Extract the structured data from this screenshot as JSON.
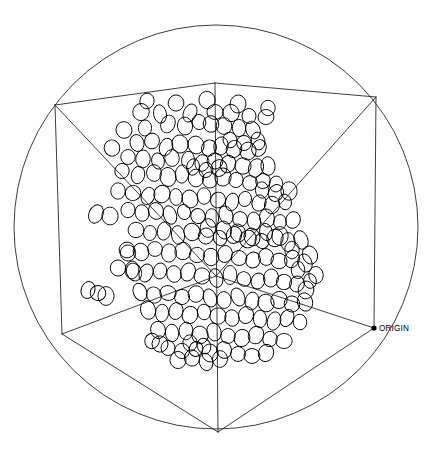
{
  "figure": {
    "background_color": "#ffffff",
    "line_color": "#1a1a1a",
    "marker_color": "#000000",
    "width": 432,
    "height": 450
  },
  "annotations": {
    "origin_label": "ORIGIN",
    "origin_point": {
      "x": 374,
      "y": 328
    }
  },
  "chart_data": {
    "type": "scatter",
    "title": "",
    "subtitle": "",
    "xlabel": "",
    "ylabel": "",
    "zlabel": "",
    "projection": "3d-oblique-wireframe-cube",
    "grid": false,
    "legend": null,
    "marker_shape": "open-ellipse",
    "marker_rx": 7.2,
    "marker_ry": 8.4,
    "n_points": 184,
    "bounding_circle": {
      "cx": 216,
      "cy": 227,
      "r": 202
    },
    "cube_vertices": {
      "front_bottom": {
        "x": 218,
        "y": 432
      },
      "left": {
        "x": 55,
        "y": 105
      },
      "left_bottom": {
        "x": 62,
        "y": 334
      },
      "right": {
        "x": 376,
        "y": 97
      },
      "right_bottom": {
        "x": 374,
        "y": 328
      },
      "top_center": {
        "x": 215,
        "y": 83
      },
      "center": {
        "x": 216,
        "y": 276
      },
      "top_front": {
        "x": 216,
        "y": 83
      }
    },
    "points": [
      [
        147,
        101
      ],
      [
        176,
        103
      ],
      [
        207,
        100
      ],
      [
        238,
        104
      ],
      [
        268,
        108
      ],
      [
        141,
        112
      ],
      [
        160,
        114
      ],
      [
        190,
        113
      ],
      [
        215,
        112
      ],
      [
        231,
        113
      ],
      [
        249,
        116
      ],
      [
        266,
        117
      ],
      [
        124,
        130
      ],
      [
        145,
        128
      ],
      [
        168,
        124
      ],
      [
        185,
        126
      ],
      [
        199,
        122
      ],
      [
        211,
        124
      ],
      [
        224,
        126
      ],
      [
        239,
        128
      ],
      [
        253,
        130
      ],
      [
        137,
        143
      ],
      [
        152,
        141
      ],
      [
        166,
        147
      ],
      [
        180,
        144
      ],
      [
        196,
        145
      ],
      [
        209,
        148
      ],
      [
        221,
        146
      ],
      [
        234,
        149
      ],
      [
        248,
        151
      ],
      [
        259,
        148
      ],
      [
        112,
        148
      ],
      [
        128,
        157
      ],
      [
        143,
        159
      ],
      [
        158,
        161
      ],
      [
        172,
        158
      ],
      [
        188,
        160
      ],
      [
        202,
        163
      ],
      [
        215,
        161
      ],
      [
        228,
        164
      ],
      [
        243,
        166
      ],
      [
        256,
        168
      ],
      [
        268,
        166
      ],
      [
        122,
        171
      ],
      [
        138,
        175
      ],
      [
        154,
        173
      ],
      [
        168,
        177
      ],
      [
        182,
        174
      ],
      [
        196,
        178
      ],
      [
        210,
        180
      ],
      [
        223,
        177
      ],
      [
        236,
        180
      ],
      [
        250,
        183
      ],
      [
        263,
        181
      ],
      [
        276,
        184
      ],
      [
        118,
        191
      ],
      [
        133,
        193
      ],
      [
        148,
        196
      ],
      [
        162,
        194
      ],
      [
        176,
        197
      ],
      [
        190,
        199
      ],
      [
        204,
        196
      ],
      [
        218,
        200
      ],
      [
        232,
        202
      ],
      [
        245,
        199
      ],
      [
        259,
        203
      ],
      [
        272,
        205
      ],
      [
        285,
        202
      ],
      [
        128,
        210
      ],
      [
        142,
        213
      ],
      [
        156,
        211
      ],
      [
        170,
        215
      ],
      [
        184,
        212
      ],
      [
        198,
        216
      ],
      [
        212,
        218
      ],
      [
        226,
        215
      ],
      [
        240,
        219
      ],
      [
        254,
        221
      ],
      [
        267,
        218
      ],
      [
        280,
        222
      ],
      [
        293,
        220
      ],
      [
        96,
        214
      ],
      [
        110,
        216
      ],
      [
        136,
        230
      ],
      [
        150,
        233
      ],
      [
        164,
        231
      ],
      [
        178,
        235
      ],
      [
        192,
        232
      ],
      [
        206,
        236
      ],
      [
        220,
        238
      ],
      [
        234,
        235
      ],
      [
        248,
        239
      ],
      [
        262,
        241
      ],
      [
        275,
        238
      ],
      [
        288,
        242
      ],
      [
        301,
        240
      ],
      [
        127,
        250
      ],
      [
        141,
        252
      ],
      [
        155,
        249
      ],
      [
        169,
        253
      ],
      [
        183,
        251
      ],
      [
        197,
        255
      ],
      [
        211,
        257
      ],
      [
        225,
        254
      ],
      [
        239,
        258
      ],
      [
        253,
        260
      ],
      [
        266,
        257
      ],
      [
        279,
        261
      ],
      [
        292,
        259
      ],
      [
        305,
        263
      ],
      [
        118,
        268
      ],
      [
        132,
        270
      ],
      [
        146,
        273
      ],
      [
        160,
        271
      ],
      [
        174,
        274
      ],
      [
        188,
        272
      ],
      [
        202,
        276
      ],
      [
        216,
        278
      ],
      [
        230,
        275
      ],
      [
        244,
        279
      ],
      [
        258,
        281
      ],
      [
        271,
        278
      ],
      [
        284,
        282
      ],
      [
        297,
        284
      ],
      [
        310,
        281
      ],
      [
        88,
        290
      ],
      [
        98,
        293
      ],
      [
        106,
        296
      ],
      [
        140,
        292
      ],
      [
        154,
        295
      ],
      [
        168,
        293
      ],
      [
        182,
        297
      ],
      [
        196,
        294
      ],
      [
        210,
        298
      ],
      [
        224,
        300
      ],
      [
        238,
        297
      ],
      [
        252,
        301
      ],
      [
        266,
        303
      ],
      [
        279,
        300
      ],
      [
        292,
        304
      ],
      [
        305,
        302
      ],
      [
        148,
        310
      ],
      [
        162,
        313
      ],
      [
        176,
        311
      ],
      [
        190,
        315
      ],
      [
        204,
        312
      ],
      [
        218,
        316
      ],
      [
        232,
        318
      ],
      [
        246,
        315
      ],
      [
        260,
        319
      ],
      [
        274,
        321
      ],
      [
        287,
        318
      ],
      [
        300,
        322
      ],
      [
        158,
        330
      ],
      [
        172,
        333
      ],
      [
        186,
        331
      ],
      [
        200,
        335
      ],
      [
        214,
        332
      ],
      [
        228,
        336
      ],
      [
        242,
        338
      ],
      [
        256,
        335
      ],
      [
        270,
        339
      ],
      [
        284,
        341
      ],
      [
        168,
        348
      ],
      [
        182,
        351
      ],
      [
        196,
        349
      ],
      [
        210,
        353
      ],
      [
        224,
        350
      ],
      [
        238,
        354
      ],
      [
        252,
        356
      ],
      [
        266,
        353
      ],
      [
        152,
        341
      ],
      [
        160,
        344
      ],
      [
        190,
        343
      ],
      [
        204,
        346
      ],
      [
        178,
        360
      ],
      [
        192,
        358
      ],
      [
        206,
        362
      ],
      [
        220,
        359
      ],
      [
        208,
        228
      ],
      [
        224,
        230
      ],
      [
        238,
        233
      ],
      [
        252,
        237
      ],
      [
        266,
        232
      ],
      [
        280,
        236
      ],
      [
        193,
        167
      ],
      [
        206,
        170
      ],
      [
        219,
        168
      ],
      [
        230,
        140
      ],
      [
        244,
        143
      ],
      [
        258,
        141
      ],
      [
        262,
        190
      ],
      [
        276,
        193
      ],
      [
        289,
        191
      ],
      [
        292,
        250
      ],
      [
        298,
        270
      ],
      [
        306,
        290
      ],
      [
        310,
        255
      ],
      [
        316,
        275
      ],
      [
        128,
        253
      ],
      [
        134,
        272
      ]
    ]
  }
}
